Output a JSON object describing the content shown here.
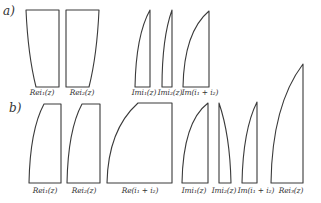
{
  "figure": {
    "row_a": {
      "label": "a)",
      "shapes": [
        {
          "id": "a-rei1",
          "label": "Rei₁(z)",
          "label_x": 42
        },
        {
          "id": "a-rei2",
          "label": "Rei₂(z)",
          "label_x": 82
        },
        {
          "id": "a-imi1",
          "label": "Imi₁(z)",
          "label_x": 145
        },
        {
          "id": "a-imi2",
          "label": "Imi₂(z)",
          "label_x": 171
        },
        {
          "id": "a-im-sum",
          "label": "Im(i₁ + i₂)",
          "label_x": 200
        }
      ]
    },
    "row_b": {
      "label": "b)",
      "shapes": [
        {
          "id": "b-rei1",
          "label": "Rei₁(z)",
          "label_x": 44
        },
        {
          "id": "b-rei2",
          "label": "Rei₂(z)",
          "label_x": 84
        },
        {
          "id": "b-re-sum",
          "label": "Re(i₁ + i₂)",
          "label_x": 139
        },
        {
          "id": "b-imi1",
          "label": "Imi₁(z)",
          "label_x": 196
        },
        {
          "id": "b-imi2",
          "label": "Imi₂(z)",
          "label_x": 225
        },
        {
          "id": "b-im-sum",
          "label": "Im(i₁ + i₂)",
          "label_x": 256
        },
        {
          "id": "b-rei3",
          "label": "Rei₃(z)",
          "label_x": 294
        }
      ]
    }
  }
}
